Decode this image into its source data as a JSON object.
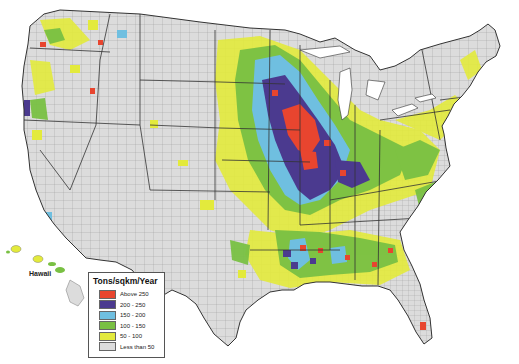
{
  "map": {
    "subject": "Contiguous United States by county, plus Hawaii",
    "inset_label": "Hawaii"
  },
  "legend": {
    "title": "Tons/sqkm/Year",
    "items": [
      {
        "label": "Above 250",
        "color": "#e8452f"
      },
      {
        "label": "200 - 250",
        "color": "#4b3a8f"
      },
      {
        "label": "150 - 200",
        "color": "#6fbfe0"
      },
      {
        "label": "100 - 150",
        "color": "#79c043"
      },
      {
        "label": "50 - 100",
        "color": "#e3ea3c"
      },
      {
        "label": "Less than 50",
        "color": "#dcdcdc"
      }
    ]
  },
  "colors": {
    "background": "#ffffff",
    "boundary": "#333333",
    "county_line": "#8a8a8a"
  }
}
